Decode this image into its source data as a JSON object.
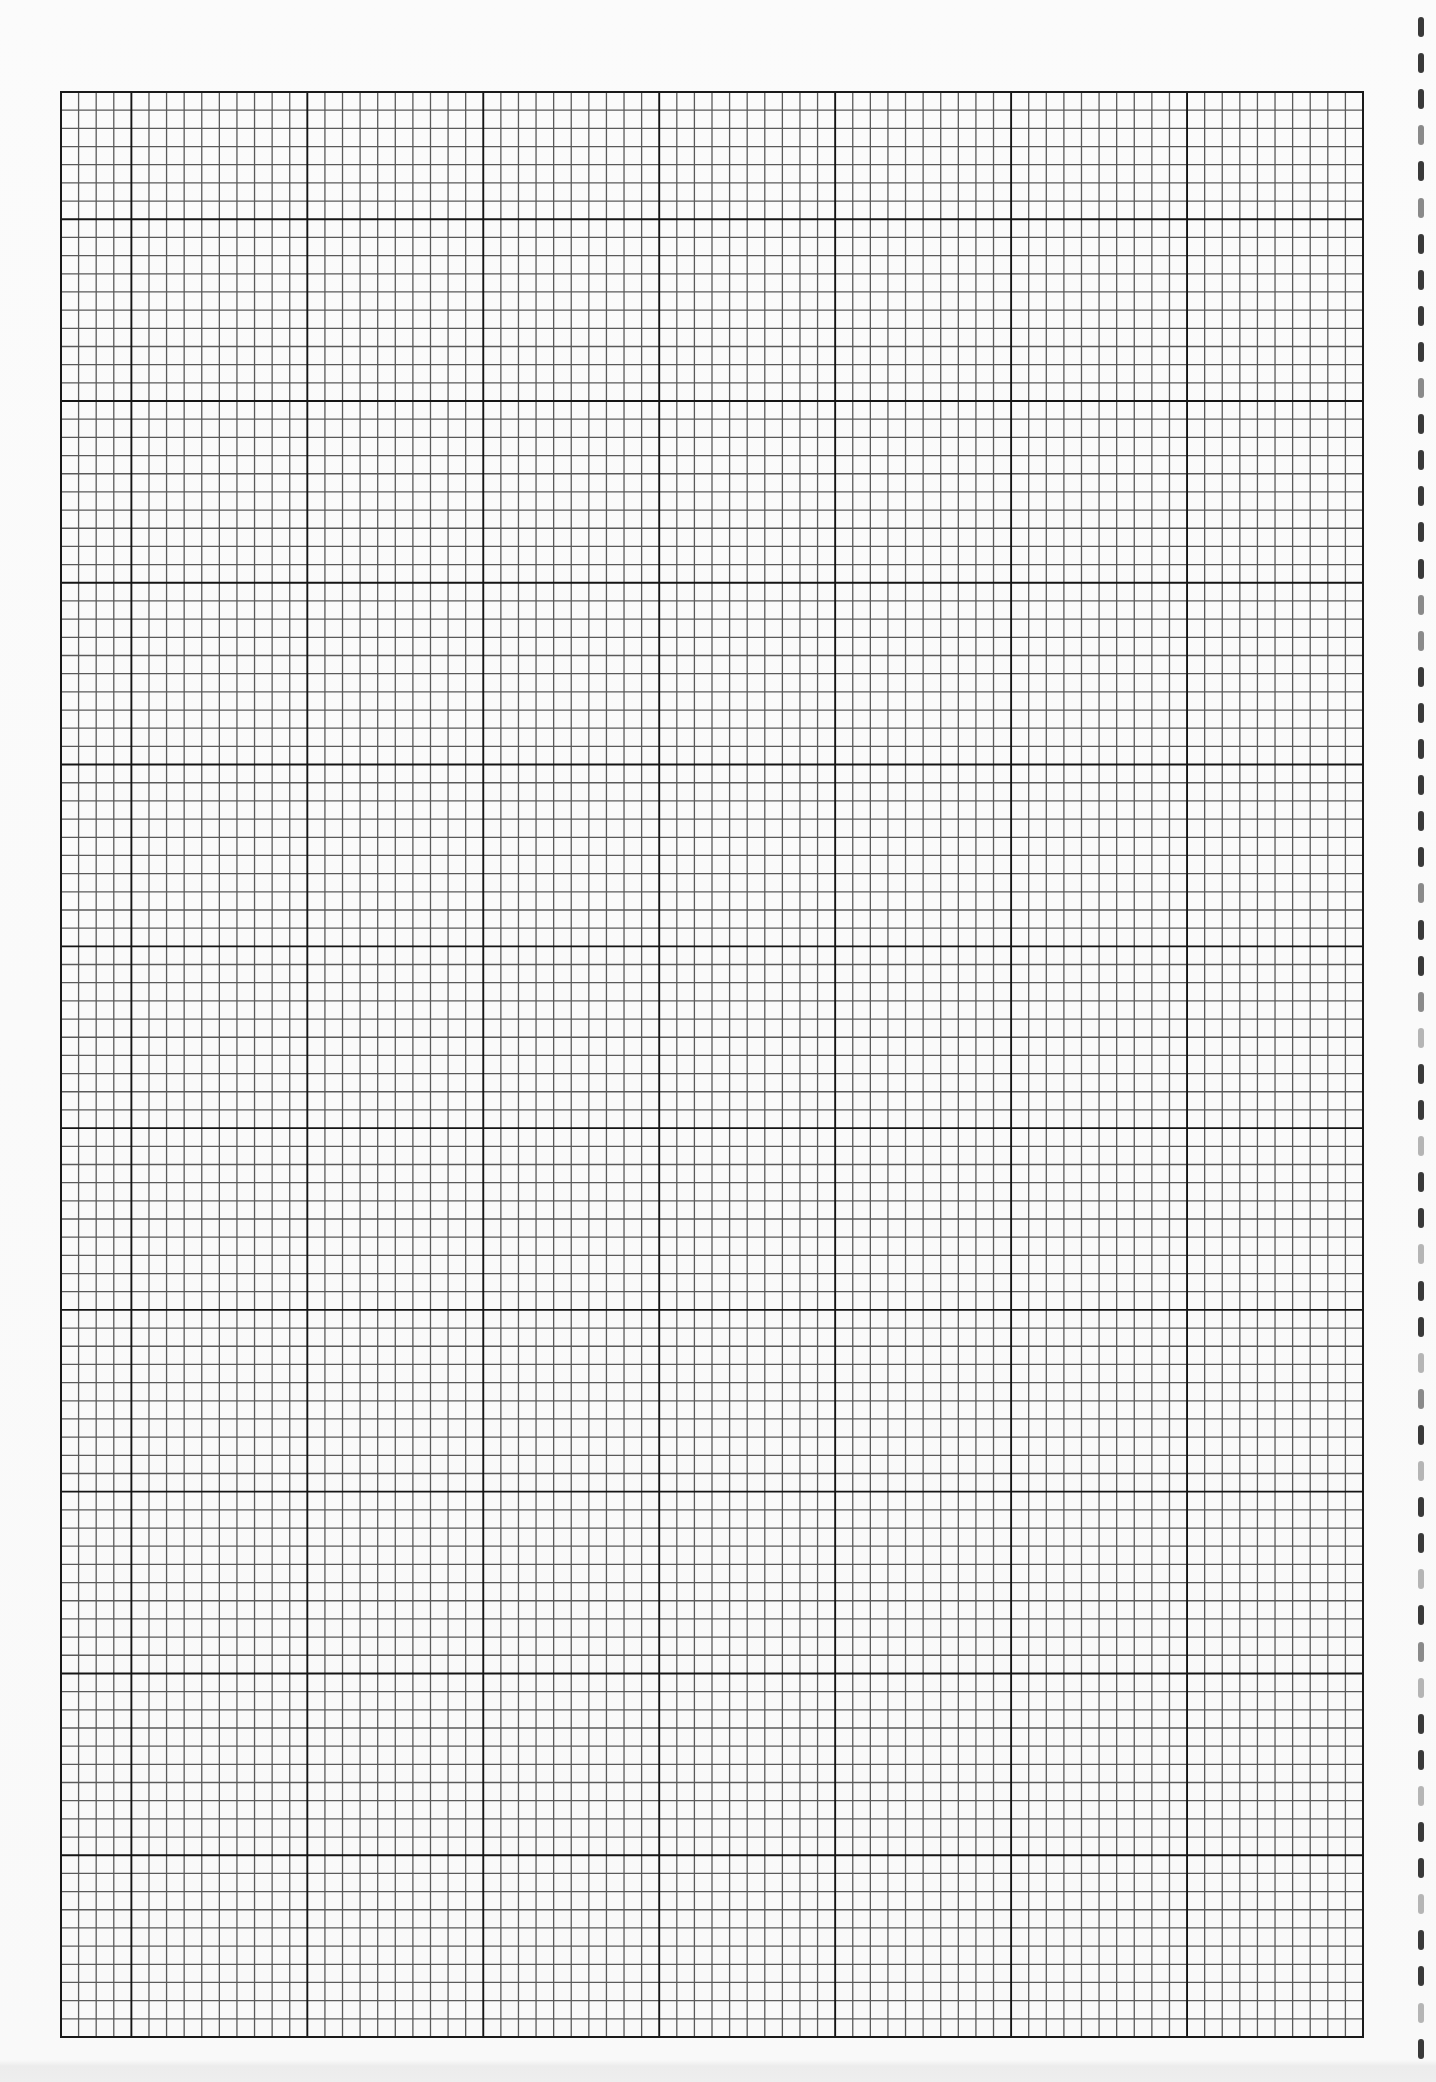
{
  "sheet": {
    "type": "graph-paper",
    "background": "#f9f9f9",
    "footer_band_color": "#eeeeee"
  },
  "grid": {
    "left": 61,
    "top": 92,
    "right": 1363,
    "bottom": 2037,
    "columns": 74,
    "rows": 107,
    "major_every": 10,
    "first_major_col_offset": 4,
    "first_major_row_offset": 7,
    "minor_line_color": "#5a5a5a",
    "major_line_color": "#151515",
    "border_color": "#1a1a1a",
    "minor_line_width": 1.3,
    "major_line_width": 1.9
  },
  "binding": {
    "x": 1421,
    "first_y": 17,
    "spacing": 36.1,
    "count": 57,
    "icon": "binding-hole-icon"
  }
}
